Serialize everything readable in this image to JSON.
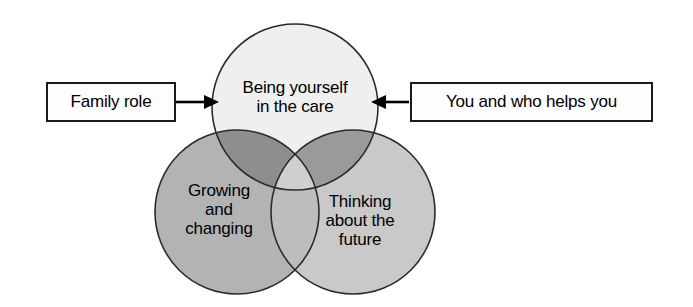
{
  "diagram": {
    "type": "venn-three-circle",
    "background_color": "#ffffff",
    "circles": [
      {
        "id": "being-yourself",
        "label": "Being yourself\nin the care",
        "fill_color": "#efefef",
        "stroke_color": "#2b2b2b",
        "cx": 295,
        "cy": 107,
        "r": 83
      },
      {
        "id": "growing-and-changing",
        "label": "Growing\nand\nchanging",
        "fill_color": "#b3b3b3",
        "stroke_color": "#2b2b2b",
        "cx": 237,
        "cy": 212,
        "r": 82
      },
      {
        "id": "thinking-about-the-future",
        "label": "Thinking\nabout the\nfuture",
        "fill_color": "#c9c9c9",
        "stroke_color": "#2b2b2b",
        "cx": 353,
        "cy": 212,
        "r": 82
      }
    ],
    "overlap_colors": {
      "top_with_bottom_left": "#8e8e8e",
      "top_with_bottom_right": "#9a9a9a",
      "bottom_left_with_bottom_right": "#bdbdbd",
      "triple_center": "#cfcfcf"
    },
    "callouts": [
      {
        "id": "family-role",
        "text": "Family role",
        "arrow_direction": "right",
        "border_color": "#1a1a1a",
        "fill_color": "#fdfdfd"
      },
      {
        "id": "you-and-who-helps-you",
        "text": "You and who helps you",
        "arrow_direction": "left",
        "border_color": "#1a1a1a",
        "fill_color": "#fdfdfd"
      }
    ]
  }
}
